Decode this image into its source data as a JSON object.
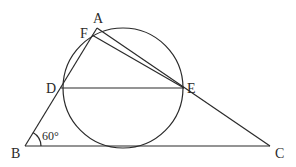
{
  "diagram": {
    "type": "geometry",
    "points": {
      "A": {
        "label": "A",
        "x": 97,
        "y": 28
      },
      "F": {
        "label": "F",
        "x": 92,
        "y": 35
      },
      "D": {
        "label": "D",
        "x": 61,
        "y": 88
      },
      "E": {
        "label": "E",
        "x": 184,
        "y": 88
      },
      "B": {
        "label": "B",
        "x": 25,
        "y": 146
      },
      "C": {
        "label": "C",
        "x": 270,
        "y": 146
      }
    },
    "circle": {
      "cx": 123,
      "cy": 88,
      "r": 60
    },
    "segments": [
      "AB",
      "AC",
      "BC",
      "DE",
      "FE"
    ],
    "angle_marker": {
      "vertex": "B",
      "label": "60°"
    },
    "line_color": "#2a2a2a"
  }
}
